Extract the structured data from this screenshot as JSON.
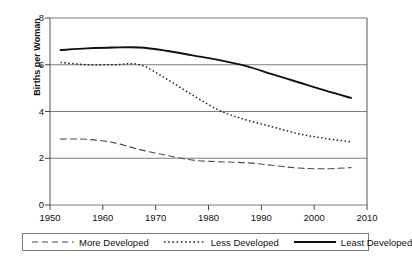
{
  "chart_data": {
    "type": "line",
    "title": "",
    "xlabel": "",
    "ylabel": "Births per Woman",
    "xlim": [
      1950,
      2010
    ],
    "ylim": [
      0,
      8
    ],
    "xticks": [
      1950,
      1960,
      1970,
      1980,
      1990,
      2000,
      2010
    ],
    "yticks": [
      0,
      2,
      4,
      6,
      8
    ],
    "grid": "horizontal",
    "legend_position": "bottom",
    "series": [
      {
        "name": "More Developed",
        "style": "dashed",
        "color": "#4d4d4d",
        "x": [
          1952,
          1957,
          1962,
          1967,
          1972,
          1977,
          1982,
          1987,
          1992,
          1997,
          2002,
          2007
        ],
        "values": [
          2.82,
          2.81,
          2.67,
          2.37,
          2.13,
          1.92,
          1.85,
          1.81,
          1.7,
          1.58,
          1.55,
          1.6
        ]
      },
      {
        "name": "Less Developed",
        "style": "dotted",
        "color": "#222222",
        "x": [
          1952,
          1957,
          1962,
          1967,
          1972,
          1977,
          1982,
          1987,
          1992,
          1997,
          2002,
          2007
        ],
        "values": [
          6.1,
          6.0,
          6.0,
          6.0,
          5.4,
          4.7,
          4.05,
          3.65,
          3.35,
          3.05,
          2.85,
          2.7
        ]
      },
      {
        "name": "Least Developed",
        "style": "solid",
        "color": "#111111",
        "x": [
          1952,
          1957,
          1962,
          1967,
          1972,
          1977,
          1982,
          1987,
          1992,
          1997,
          2002,
          2007
        ],
        "values": [
          6.63,
          6.7,
          6.74,
          6.74,
          6.6,
          6.4,
          6.2,
          5.95,
          5.6,
          5.25,
          4.9,
          4.58
        ]
      }
    ]
  },
  "axis": {
    "y_label": "Births per Woman",
    "y_ticks": [
      "0",
      "2",
      "4",
      "6",
      "8"
    ],
    "x_ticks": [
      "1950",
      "1960",
      "1970",
      "1980",
      "1990",
      "2000",
      "2010"
    ]
  },
  "legend": {
    "items": [
      {
        "label": "More Developed",
        "style": "dashed"
      },
      {
        "label": "Less Developed",
        "style": "dotted"
      },
      {
        "label": "Least Developed",
        "style": "solid"
      }
    ]
  },
  "caption": {
    "text": ""
  }
}
